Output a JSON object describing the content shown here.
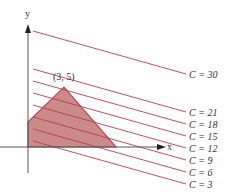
{
  "diagram": {
    "axes": {
      "x_label": "x",
      "y_label": "y",
      "axis_color": "#555555"
    },
    "vertex_label": "(3, 5)",
    "region": {
      "fill": "#c98585",
      "stroke": "#b04848",
      "points": [
        [
          28,
          147
        ],
        [
          28,
          122
        ],
        [
          64,
          87
        ],
        [
          116,
          147
        ]
      ]
    },
    "level_lines": [
      {
        "label": "C = 30",
        "C": 30
      },
      {
        "label": "C = 21",
        "C": 21
      },
      {
        "label": "C = 18",
        "C": 18
      },
      {
        "label": "C = 15",
        "C": 15
      },
      {
        "label": "C = 12",
        "C": 12
      },
      {
        "label": "C = 9",
        "C": 9
      },
      {
        "label": "C = 6",
        "C": 6
      },
      {
        "label": "C = 3",
        "C": 3
      }
    ],
    "line_color": "#b5404a"
  }
}
